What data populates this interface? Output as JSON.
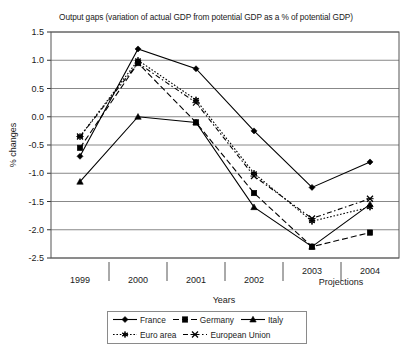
{
  "chart_data": {
    "type": "line",
    "title": "Output gaps (variation of actual GDP from potential GDP as a % of potential GDP)",
    "xlabel": "Years",
    "ylabel": "% changes",
    "categories": [
      "1999",
      "2000",
      "2001",
      "2002",
      "2003",
      "2004"
    ],
    "ylim": [
      -2.5,
      1.5
    ],
    "ytick_labels": [
      "1.5",
      "1.0",
      "0.5",
      "0.0",
      "-0.5",
      "-1.0",
      "-1.5",
      "-2.0",
      "-2.5"
    ],
    "ytick_values": [
      1.5,
      1.0,
      0.5,
      0.0,
      -0.5,
      -1.0,
      -1.5,
      -2.0,
      -2.5
    ],
    "grid": true,
    "legend_position": "bottom",
    "annotation": "Projections",
    "annotation_categories": [
      "2003",
      "2004"
    ],
    "series": [
      {
        "name": "France",
        "marker": "diamond",
        "linestyle": "solid",
        "color": "#000000",
        "values": [
          -0.7,
          1.2,
          0.85,
          -0.25,
          -1.25,
          -0.8
        ]
      },
      {
        "name": "Germany",
        "marker": "square",
        "linestyle": "dashed",
        "color": "#000000",
        "values": [
          -0.55,
          0.95,
          -0.1,
          -1.35,
          -2.3,
          -2.05
        ]
      },
      {
        "name": "Italy",
        "marker": "triangle",
        "linestyle": "solid",
        "color": "#000000",
        "values": [
          -1.15,
          0.0,
          -0.1,
          -1.6,
          -2.3,
          -1.55
        ]
      },
      {
        "name": "Euro area",
        "marker": "asterisk",
        "linestyle": "dotted",
        "color": "#000000",
        "values": [
          -0.35,
          1.0,
          0.3,
          -1.0,
          -1.85,
          -1.6
        ]
      },
      {
        "name": "European Union",
        "marker": "cross",
        "linestyle": "dashdot",
        "color": "#000000",
        "values": [
          -0.35,
          0.95,
          0.25,
          -1.05,
          -1.8,
          -1.45
        ]
      }
    ]
  },
  "legend": {
    "row1": [
      {
        "label": "France",
        "marker": "diamond",
        "linestyle": "solid"
      },
      {
        "label": "Germany",
        "marker": "square",
        "linestyle": "dashed"
      },
      {
        "label": "Italy",
        "marker": "triangle",
        "linestyle": "solid"
      }
    ],
    "row2": [
      {
        "label": "Euro area",
        "marker": "asterisk",
        "linestyle": "dotted"
      },
      {
        "label": "European Union",
        "marker": "cross",
        "linestyle": "dashdot"
      }
    ]
  }
}
